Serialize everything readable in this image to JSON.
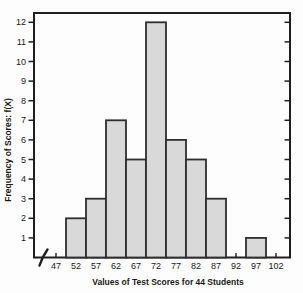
{
  "chart_data": {
    "type": "bar",
    "subtype": "histogram",
    "title": "",
    "xlabel": "Values of Test Scores for 44 Students",
    "ylabel": "Frequency of Scores: f(X)",
    "categories": [
      47,
      52,
      57,
      62,
      67,
      72,
      77,
      82,
      87,
      92,
      97,
      102
    ],
    "values": [
      0,
      2,
      3,
      7,
      5,
      12,
      6,
      5,
      3,
      0,
      1,
      0
    ],
    "ylim": [
      0,
      12
    ],
    "yticks": [
      1,
      2,
      3,
      4,
      5,
      6,
      7,
      8,
      9,
      10,
      11,
      12
    ],
    "grid": false,
    "legend": false,
    "x_axis_break": true,
    "frame": "full-box",
    "colors": {
      "bar_fill": "#d9d9d9",
      "bar_border": "#2e2e2e",
      "axis": "#1f1f1f",
      "text": "#1a1a1a",
      "background": "#fdfdfd"
    }
  }
}
